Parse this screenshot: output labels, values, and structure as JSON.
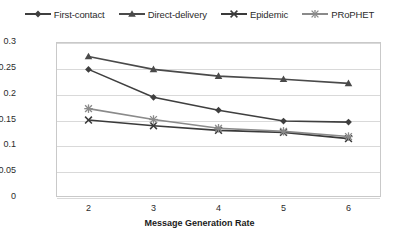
{
  "chart_data": {
    "type": "line",
    "title": "",
    "xlabel": "Message Generation Rate",
    "ylabel": "Delivery Probability",
    "x": [
      2,
      3,
      4,
      5,
      6
    ],
    "xtick_labels": [
      "2",
      "3",
      "4",
      "5",
      "6"
    ],
    "ytick_labels": [
      "0",
      "0.05",
      "0.1",
      "0.15",
      "0.2",
      "0.25",
      "0.3"
    ],
    "ytick_values": [
      0,
      0.05,
      0.1,
      0.15,
      0.2,
      0.25,
      0.3
    ],
    "xlim": [
      1.5,
      6.5
    ],
    "ylim": [
      0,
      0.3
    ],
    "grid": "horizontal",
    "legend_position": "top-center",
    "series": [
      {
        "name": "First-contact",
        "marker": "diamond",
        "color": "#3f3f3f",
        "values": [
          0.247,
          0.193,
          0.168,
          0.147,
          0.145
        ]
      },
      {
        "name": "Direct-delivery",
        "marker": "triangle",
        "color": "#4a4a4a",
        "values": [
          0.272,
          0.247,
          0.234,
          0.228,
          0.22
        ]
      },
      {
        "name": "Epidemic",
        "marker": "x-cross",
        "color": "#3a3a3a",
        "values": [
          0.149,
          0.138,
          0.129,
          0.125,
          0.113
        ]
      },
      {
        "name": "PRoPHET",
        "marker": "asterisk",
        "color": "#8a8a8a",
        "values": [
          0.171,
          0.15,
          0.133,
          0.127,
          0.117
        ]
      }
    ]
  },
  "legend": {
    "items": [
      {
        "label": "First-contact"
      },
      {
        "label": "Direct-delivery"
      },
      {
        "label": "Epidemic"
      },
      {
        "label": "PRoPHET"
      }
    ]
  },
  "colors": {
    "axis": "#c9c9c9",
    "grid": "#d9d9d9",
    "text": "#2b2b2b",
    "background": "#ffffff"
  }
}
